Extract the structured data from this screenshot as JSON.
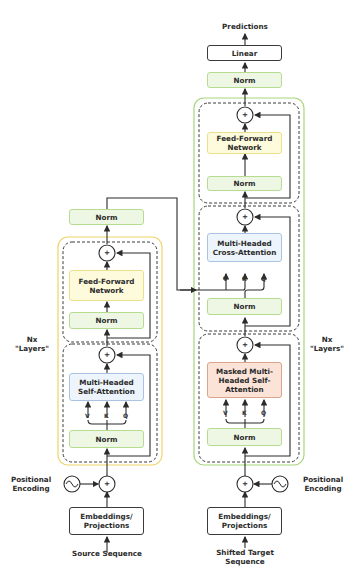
{
  "decoder": {
    "output_label": "Predictions",
    "linear_label": "Linear",
    "final_norm_label": "Norm",
    "ffn_label": "Feed-Forward Network",
    "ffn_norm_label": "Norm",
    "cross_attention_label": "Multi-Headed Cross-Attention",
    "cross_norm_label": "Norm",
    "masked_attention_label": "Masked Multi-Headed Self-Attention",
    "masked_norm_label": "Norm",
    "layers_label": "Nx \"Layers\"",
    "embeddings_label": "Embeddings/ Projections",
    "positional_label": "Positional Encoding",
    "input_label": "Shifted Target Sequence",
    "cross_v": "V",
    "cross_k": "K",
    "cross_q": "Q",
    "self_v": "V",
    "self_k": "K",
    "self_q": "Q",
    "add_symbol": "+"
  },
  "encoder": {
    "final_norm_label": "Norm",
    "ffn_label": "Feed-Forward Network",
    "ffn_norm_label": "Norm",
    "attention_label": "Multi-Headed Self-Attention",
    "attn_norm_label": "Norm",
    "layers_label": "Nx \"Layers\"",
    "embeddings_label": "Embeddings/ Projections",
    "positional_label": "Positional Encoding",
    "input_label": "Source Sequence",
    "self_v": "V",
    "self_k": "K",
    "self_q": "Q",
    "add_symbol": "+"
  },
  "colors": {
    "norm_fill": "#eef7e4",
    "ffn_fill": "#fdfbdc",
    "attention_fill": "#eef4fb",
    "masked_fill": "#fbe3d8",
    "encoder_outline": "#f0d36a",
    "decoder_outline": "#a8d67c"
  }
}
